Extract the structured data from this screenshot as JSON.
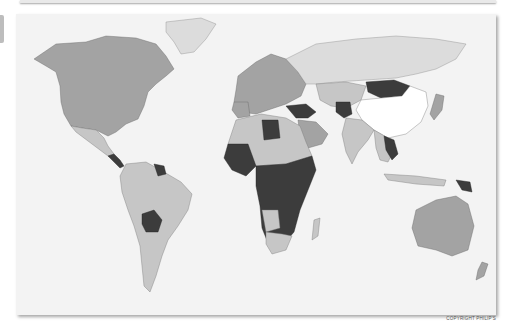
{
  "map": {
    "type": "world-choropleth",
    "style": "grayscale",
    "shading_levels": {
      "white": "#ffffff",
      "pale": "#dcdcdc",
      "light": "#c6c6c6",
      "mid": "#a3a3a3",
      "dark": "#3c3c3c"
    },
    "background_color": "#f3f3f3"
  },
  "footer": {
    "copyright": "COPYRIGHT PHILIP'S"
  }
}
